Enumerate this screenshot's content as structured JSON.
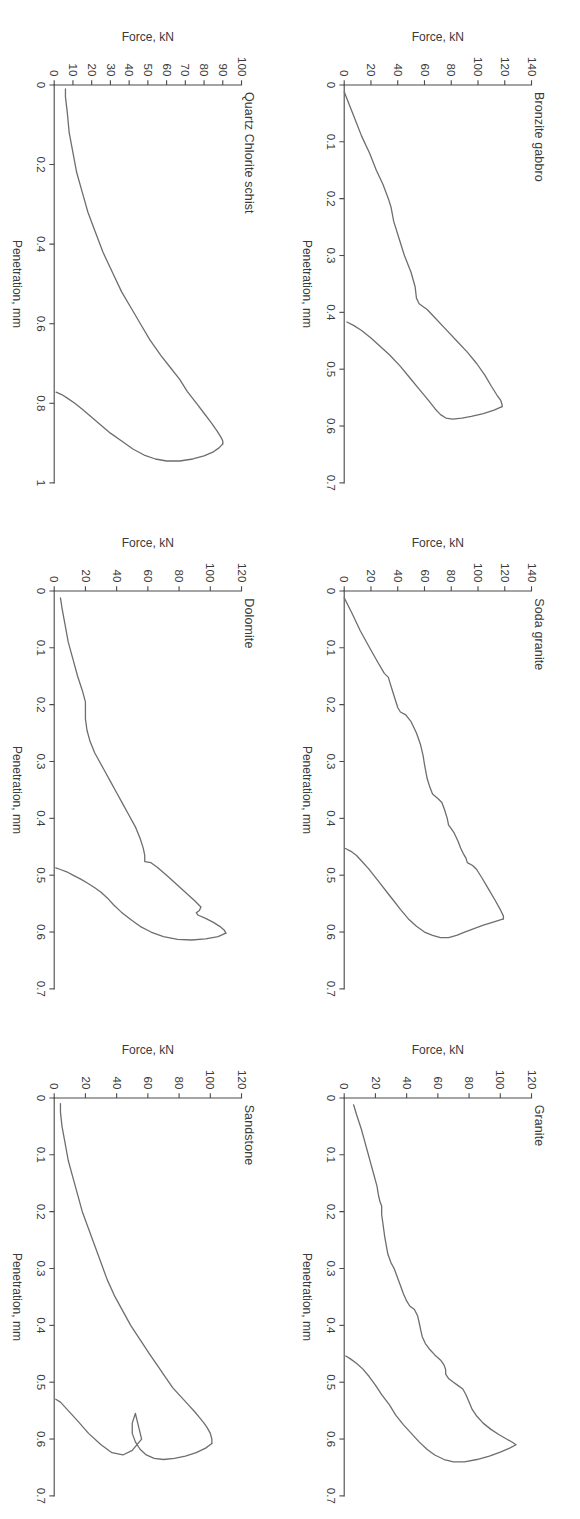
{
  "figure": {
    "rotation_note": "figure printed rotated 90 degrees on portrait page",
    "panel_count": 6,
    "line_color": "#6e6e6e",
    "axis_color": "#4a4a4a",
    "background": "#ffffff"
  },
  "chart_data": [
    {
      "type": "line",
      "title": "Bronzite gabbro",
      "xlabel": "Penetration, mm",
      "ylabel": "Force, kN",
      "xlim": [
        0,
        0.7
      ],
      "ylim": [
        0,
        140
      ],
      "xticks": [
        "0",
        "0.1",
        "0.2",
        "0.3",
        "0.4",
        "0.5",
        "0.6",
        "0.7"
      ],
      "xtick_values": [
        0,
        0.1,
        0.2,
        0.3,
        0.4,
        0.5,
        0.6,
        0.7
      ],
      "yticks": [
        "0",
        "20",
        "40",
        "60",
        "80",
        "100",
        "120",
        "140"
      ],
      "ytick_values": [
        0,
        20,
        40,
        60,
        80,
        100,
        120,
        140
      ],
      "grid": false,
      "legend": "none",
      "series": [
        {
          "name": "loading",
          "x": [
            0.012,
            0.03,
            0.06,
            0.09,
            0.12,
            0.15,
            0.175,
            0.2,
            0.215,
            0.24,
            0.27,
            0.3,
            0.33,
            0.355,
            0.375,
            0.385,
            0.395,
            0.41,
            0.43,
            0.45,
            0.47,
            0.49,
            0.51,
            0.53,
            0.545,
            0.555,
            0.562,
            0.566
          ],
          "y": [
            0,
            3,
            8,
            13,
            19,
            24,
            29,
            33,
            35,
            37,
            41,
            45,
            50,
            53,
            54,
            56,
            62,
            68,
            76,
            84,
            92,
            99,
            105,
            110,
            114,
            117,
            118,
            118
          ]
        },
        {
          "name": "unloading",
          "x": [
            0.566,
            0.572,
            0.578,
            0.583,
            0.586,
            0.588,
            0.586,
            0.58,
            0.57,
            0.555,
            0.535,
            0.515,
            0.495,
            0.475,
            0.46,
            0.445,
            0.432,
            0.423,
            0.417
          ],
          "y": [
            118,
            112,
            104,
            95,
            88,
            81,
            76,
            72,
            68,
            63,
            56,
            49,
            42,
            34,
            27,
            20,
            13,
            7,
            2
          ]
        }
      ]
    },
    {
      "type": "line",
      "title": "Soda granite",
      "xlabel": "Penetration, mm",
      "ylabel": "Force, kN",
      "xlim": [
        0,
        0.7
      ],
      "ylim": [
        0,
        140
      ],
      "xticks": [
        "0",
        "0.1",
        "0.2",
        "0.3",
        "0.4",
        "0.5",
        "0.6",
        "0.7"
      ],
      "xtick_values": [
        0,
        0.1,
        0.2,
        0.3,
        0.4,
        0.5,
        0.6,
        0.7
      ],
      "yticks": [
        "0",
        "20",
        "40",
        "60",
        "80",
        "100",
        "120",
        "140"
      ],
      "ytick_values": [
        0,
        20,
        40,
        60,
        80,
        100,
        120,
        140
      ],
      "grid": false,
      "legend": "none",
      "series": [
        {
          "name": "loading",
          "x": [
            0.012,
            0.04,
            0.07,
            0.1,
            0.125,
            0.145,
            0.152,
            0.16,
            0.175,
            0.19,
            0.205,
            0.213,
            0.218,
            0.23,
            0.25,
            0.27,
            0.29,
            0.305,
            0.318,
            0.33,
            0.345,
            0.357,
            0.365,
            0.372,
            0.385,
            0.4,
            0.412,
            0.418,
            0.425,
            0.44,
            0.452,
            0.462,
            0.47,
            0.478,
            0.483,
            0.49,
            0.505,
            0.525,
            0.545,
            0.562,
            0.572,
            0.577
          ],
          "y": [
            0,
            6,
            12,
            19,
            25,
            30,
            33,
            34,
            36,
            38,
            40,
            42,
            46,
            50,
            54,
            57,
            59,
            60,
            61,
            62,
            64,
            66,
            70,
            73,
            75,
            77,
            78,
            80,
            82,
            85,
            87,
            89,
            91,
            92,
            96,
            99,
            103,
            108,
            113,
            117,
            119,
            119
          ]
        },
        {
          "name": "unloading",
          "x": [
            0.577,
            0.582,
            0.588,
            0.595,
            0.6,
            0.606,
            0.61,
            0.61,
            0.606,
            0.6,
            0.59,
            0.577,
            0.56,
            0.545,
            0.53,
            0.515,
            0.5,
            0.488,
            0.475,
            0.465,
            0.458,
            0.453
          ],
          "y": [
            119,
            112,
            104,
            96,
            90,
            84,
            78,
            72,
            66,
            60,
            54,
            48,
            42,
            37,
            32,
            27,
            22,
            18,
            13,
            9,
            5,
            1
          ]
        }
      ]
    },
    {
      "type": "line",
      "title": "Granite",
      "xlabel": "Penetration, mm",
      "ylabel": "Force, kN",
      "xlim": [
        0,
        0.7
      ],
      "ylim": [
        0,
        120
      ],
      "xticks": [
        "0",
        "0.1",
        "0.2",
        "0.3",
        "0.4",
        "0.5",
        "0.6",
        "0.7"
      ],
      "xtick_values": [
        0,
        0.1,
        0.2,
        0.3,
        0.4,
        0.5,
        0.6,
        0.7
      ],
      "yticks": [
        "0",
        "20",
        "40",
        "60",
        "80",
        "100",
        "120"
      ],
      "ytick_values": [
        0,
        20,
        40,
        60,
        80,
        100,
        120
      ],
      "grid": false,
      "legend": "none",
      "series": [
        {
          "name": "loading",
          "x": [
            0.012,
            0.03,
            0.055,
            0.075,
            0.095,
            0.115,
            0.135,
            0.155,
            0.172,
            0.183,
            0.19,
            0.205,
            0.225,
            0.245,
            0.26,
            0.275,
            0.29,
            0.3,
            0.315,
            0.33,
            0.345,
            0.357,
            0.366,
            0.372,
            0.383,
            0.395,
            0.408,
            0.42,
            0.432,
            0.443,
            0.452,
            0.462,
            0.47,
            0.478,
            0.486,
            0.494,
            0.5,
            0.506,
            0.512,
            0.522,
            0.535,
            0.548,
            0.56,
            0.572,
            0.583,
            0.592,
            0.6,
            0.606,
            0.61
          ],
          "y": [
            6,
            8,
            11,
            13,
            15,
            17,
            19,
            21,
            22,
            23,
            24,
            24,
            25,
            26,
            27,
            28,
            30,
            32,
            34,
            36,
            38,
            40,
            42,
            45,
            47,
            48,
            49,
            50,
            52,
            55,
            58,
            62,
            64,
            65,
            65,
            67,
            70,
            73,
            76,
            78,
            80,
            82,
            85,
            89,
            94,
            99,
            104,
            108,
            110
          ]
        },
        {
          "name": "unloading",
          "x": [
            0.61,
            0.616,
            0.623,
            0.63,
            0.636,
            0.64,
            0.64,
            0.636,
            0.628,
            0.618,
            0.605,
            0.59,
            0.575,
            0.558,
            0.54,
            0.522,
            0.505,
            0.49,
            0.477,
            0.467,
            0.459,
            0.454
          ],
          "y": [
            110,
            106,
            100,
            93,
            85,
            77,
            70,
            64,
            58,
            53,
            48,
            43,
            38,
            33,
            29,
            24,
            20,
            16,
            12,
            8,
            4,
            1
          ]
        }
      ]
    },
    {
      "type": "line",
      "title": "Quartz Chlorite schist",
      "xlabel": "Penetration, mm",
      "ylabel": "Force, kN",
      "xlim": [
        0,
        1
      ],
      "ylim": [
        0,
        100
      ],
      "xticks": [
        "0",
        "0.2",
        "0.4",
        "0.6",
        "0.8",
        "1"
      ],
      "xtick_values": [
        0,
        0.2,
        0.4,
        0.6,
        0.8,
        1
      ],
      "yticks": [
        "0",
        "10",
        "20",
        "30",
        "40",
        "50",
        "60",
        "70",
        "80",
        "90",
        "100"
      ],
      "ytick_values": [
        0,
        10,
        20,
        30,
        40,
        50,
        60,
        70,
        80,
        90,
        100
      ],
      "grid": false,
      "legend": "none",
      "series": [
        {
          "name": "loading",
          "x": [
            0.01,
            0.03,
            0.07,
            0.12,
            0.17,
            0.22,
            0.27,
            0.32,
            0.37,
            0.42,
            0.47,
            0.52,
            0.56,
            0.6,
            0.64,
            0.68,
            0.71,
            0.74,
            0.77,
            0.8,
            0.825,
            0.85,
            0.87,
            0.885,
            0.895,
            0.902
          ],
          "y": [
            6,
            6,
            7,
            8,
            10,
            12,
            15,
            18,
            22,
            26,
            31,
            36,
            41,
            46,
            51,
            57,
            62,
            67,
            71,
            76,
            80,
            84,
            87,
            89,
            90,
            90
          ]
        },
        {
          "name": "unloading",
          "x": [
            0.902,
            0.912,
            0.922,
            0.932,
            0.94,
            0.945,
            0.945,
            0.94,
            0.93,
            0.915,
            0.895,
            0.875,
            0.855,
            0.835,
            0.815,
            0.8,
            0.787,
            0.778,
            0.772
          ],
          "y": [
            90,
            88,
            85,
            80,
            74,
            67,
            60,
            54,
            48,
            42,
            36,
            30,
            25,
            20,
            15,
            11,
            7,
            4,
            1
          ]
        }
      ]
    },
    {
      "type": "line",
      "title": "Dolomite",
      "xlabel": "Penetration, mm",
      "ylabel": "Force, kN",
      "xlim": [
        0,
        0.7
      ],
      "ylim": [
        0,
        120
      ],
      "xticks": [
        "0",
        "0.1",
        "0.2",
        "0.3",
        "0.4",
        "0.5",
        "0.6",
        "0.7"
      ],
      "xtick_values": [
        0,
        0.1,
        0.2,
        0.3,
        0.4,
        0.5,
        0.6,
        0.7
      ],
      "yticks": [
        "0",
        "20",
        "40",
        "60",
        "80",
        "100",
        "120"
      ],
      "ytick_values": [
        0,
        20,
        40,
        60,
        80,
        100,
        120
      ],
      "grid": false,
      "legend": "none",
      "series": [
        {
          "name": "loading",
          "x": [
            0.012,
            0.03,
            0.06,
            0.09,
            0.12,
            0.15,
            0.175,
            0.195,
            0.21,
            0.225,
            0.245,
            0.265,
            0.285,
            0.3,
            0.315,
            0.335,
            0.355,
            0.375,
            0.395,
            0.415,
            0.435,
            0.452,
            0.465,
            0.472,
            0.476,
            0.478,
            0.486,
            0.5,
            0.515,
            0.53,
            0.545,
            0.556,
            0.562,
            0.566,
            0.57,
            0.576,
            0.583,
            0.59,
            0.597,
            0.602
          ],
          "y": [
            4,
            5,
            7,
            9,
            12,
            15,
            18,
            20,
            20,
            20,
            21,
            23,
            26,
            29,
            32,
            36,
            40,
            44,
            48,
            52,
            55,
            57,
            58,
            58,
            58,
            62,
            66,
            72,
            78,
            84,
            90,
            94,
            93,
            91,
            92,
            97,
            102,
            106,
            109,
            110
          ]
        },
        {
          "name": "unloading",
          "x": [
            0.602,
            0.608,
            0.612,
            0.614,
            0.613,
            0.608,
            0.6,
            0.59,
            0.578,
            0.565,
            0.552,
            0.54,
            0.53,
            0.522,
            0.515,
            0.507,
            0.5,
            0.494,
            0.49,
            0.487
          ],
          "y": [
            110,
            105,
            97,
            88,
            79,
            70,
            62,
            55,
            49,
            43,
            38,
            34,
            30,
            26,
            22,
            17,
            12,
            8,
            4,
            1
          ]
        }
      ]
    },
    {
      "type": "line",
      "title": "Sandstone",
      "xlabel": "Penetration, mm",
      "ylabel": "Force, kN",
      "xlim": [
        0,
        0.7
      ],
      "ylim": [
        0,
        120
      ],
      "xticks": [
        "0",
        "0.1",
        "0.2",
        "0.3",
        "0.4",
        "0.5",
        "0.6",
        "0.7"
      ],
      "xtick_values": [
        0,
        0.1,
        0.2,
        0.3,
        0.4,
        0.5,
        0.6,
        0.7
      ],
      "yticks": [
        "0",
        "20",
        "40",
        "60",
        "80",
        "100",
        "120"
      ],
      "ytick_values": [
        0,
        20,
        40,
        60,
        80,
        100,
        120
      ],
      "grid": false,
      "legend": "none",
      "series": [
        {
          "name": "loading",
          "x": [
            0.01,
            0.025,
            0.05,
            0.08,
            0.11,
            0.14,
            0.17,
            0.2,
            0.23,
            0.26,
            0.29,
            0.32,
            0.35,
            0.375,
            0.4,
            0.425,
            0.45,
            0.47,
            0.49,
            0.51,
            0.525,
            0.54,
            0.552,
            0.562,
            0.572,
            0.58,
            0.59,
            0.6,
            0.608
          ],
          "y": [
            4,
            4,
            5,
            7,
            9,
            12,
            15,
            18,
            22,
            26,
            30,
            34,
            39,
            44,
            49,
            55,
            61,
            66,
            71,
            76,
            81,
            86,
            90,
            93,
            96,
            98,
            100,
            101,
            101
          ]
        },
        {
          "name": "unloading",
          "x": [
            0.608,
            0.616,
            0.624,
            0.63,
            0.634,
            0.636,
            0.634,
            0.628,
            0.618,
            0.605,
            0.59,
            0.572,
            0.555,
            0.6,
            0.62,
            0.628,
            0.624,
            0.61,
            0.59,
            0.568,
            0.55,
            0.535,
            0.53
          ],
          "y": [
            101,
            97,
            91,
            84,
            77,
            70,
            64,
            59,
            55,
            52,
            50,
            50,
            52,
            56,
            50,
            44,
            37,
            30,
            22,
            15,
            9,
            4,
            1
          ]
        }
      ]
    }
  ]
}
